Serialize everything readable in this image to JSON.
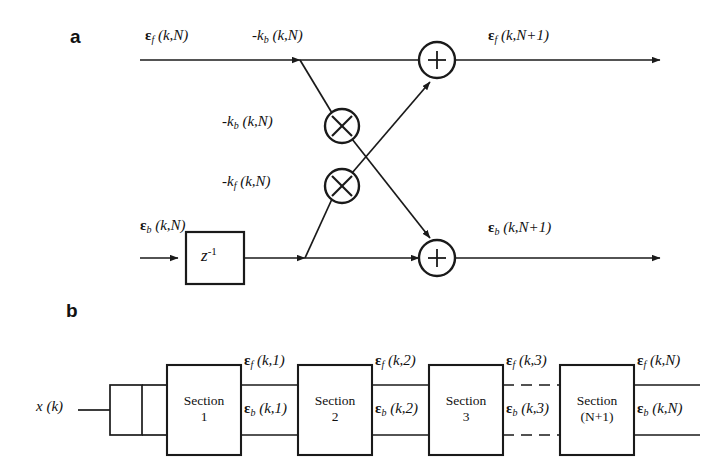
{
  "figure": {
    "type": "block-diagram"
  },
  "panels": {
    "a": {
      "label": "a",
      "signals": {
        "forward_in": "ε",
        "forward_in_sub": "f",
        "forward_in_args": "(k,N)",
        "forward_out_args": "(k,N+1)",
        "backward_in": "ε",
        "backward_in_sub": "b",
        "backward_in_args": "(k,N)",
        "backward_out_args": "(k,N+1)"
      },
      "coefficients": {
        "top_rail_tap": {
          "text": "-k",
          "sub": "b",
          "args": "(k,N)"
        },
        "mult_upper": {
          "text": "-k",
          "sub": "b",
          "args": "(k,N)"
        },
        "mult_lower": {
          "text": "-k",
          "sub": "f",
          "args": "(k,N)"
        }
      },
      "delay_block": {
        "base": "z",
        "exponent": "-1"
      },
      "operators": {
        "multiply": "X",
        "add": "+"
      }
    },
    "b": {
      "label": "b",
      "input": {
        "base": "x",
        "args": "(k)"
      },
      "sections": [
        {
          "name": "Section",
          "index": "1"
        },
        {
          "name": "Section",
          "index": "2"
        },
        {
          "name": "Section",
          "index": "3"
        },
        {
          "name": "Section",
          "index": "(N+1)"
        }
      ],
      "interconnects": [
        {
          "f_args": "(k,1)",
          "b_args": "(k,1)"
        },
        {
          "f_args": "(k,2)",
          "b_args": "(k,2)"
        },
        {
          "f_args": "(k,3)",
          "b_args": "(k,3)"
        },
        {
          "f_args": "(k,N)",
          "b_args": "(k,N)"
        }
      ],
      "epsilon": "ε",
      "f_sub": "f",
      "b_sub": "b"
    }
  },
  "colors": {
    "background": "#ffffff",
    "stroke": "#1a1a1a",
    "text": "#111111"
  }
}
